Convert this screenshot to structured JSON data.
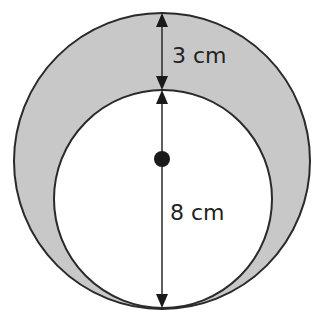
{
  "diagram": {
    "outer_circle": {
      "cx": 162,
      "cy": 161,
      "r": 148,
      "fill": "#c8c8c8",
      "stroke": "#2a2a2a"
    },
    "inner_circle": {
      "cx": 163,
      "cy": 199,
      "r": 109,
      "fill": "#ffffff",
      "stroke": "#2a2a2a"
    },
    "center_dot": {
      "cx": 162,
      "cy": 159,
      "r": 8,
      "fill": "#1a1a1a"
    },
    "dimensions": [
      {
        "label": "3 cm",
        "from_y": 13,
        "to_y": 90,
        "x": 162,
        "label_x": 172,
        "label_y": 63
      },
      {
        "label": "8 cm",
        "from_y": 90,
        "to_y": 308,
        "x": 162,
        "label_x": 170,
        "label_y": 220
      }
    ]
  }
}
